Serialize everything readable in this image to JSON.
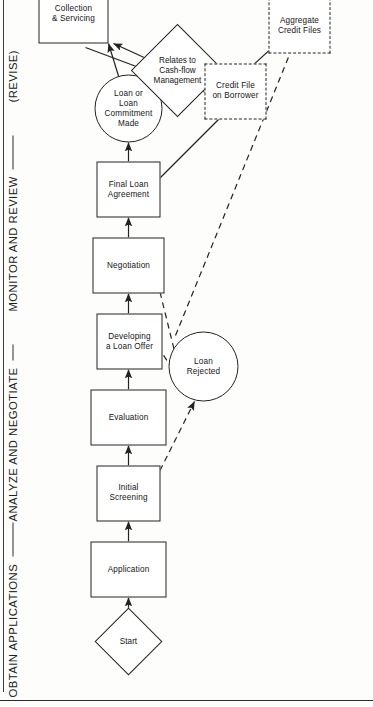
{
  "figure": {
    "orientation": "landscape-printed-sideways",
    "line_color": "#222222",
    "background": "#fdfdfc"
  },
  "phases": [
    {
      "id": "obtain",
      "label": "OBTAIN APPLICATIONS"
    },
    {
      "id": "analyze",
      "label": "ANALYZE AND NEGOTIATE"
    },
    {
      "id": "monitor",
      "label": "MONITOR AND REVIEW"
    },
    {
      "id": "revise",
      "label": "(REVISE)"
    }
  ],
  "nodes": [
    {
      "id": "start",
      "shape": "diamond",
      "label": "Start"
    },
    {
      "id": "application",
      "shape": "box",
      "label": "Application"
    },
    {
      "id": "screening",
      "shape": "box",
      "label": "Initial\nScreening"
    },
    {
      "id": "evaluation",
      "shape": "box",
      "label": "Evaluation"
    },
    {
      "id": "developing",
      "shape": "box",
      "label": "Developing\na Loan Offer"
    },
    {
      "id": "negotiation",
      "shape": "box",
      "label": "Negotiation"
    },
    {
      "id": "agreement",
      "shape": "box",
      "label": "Final Loan\nAgreement"
    },
    {
      "id": "commitment",
      "shape": "circle",
      "label": "Loan or\nLoan\nCommitment\nMade"
    },
    {
      "id": "cashflow",
      "shape": "diamond",
      "label": "Relates to\nCash-flow\nManagement"
    },
    {
      "id": "collection",
      "shape": "box",
      "label": "Collection\n& Servicing"
    },
    {
      "id": "rejected",
      "shape": "circle",
      "label": "Loan\nRejected"
    },
    {
      "id": "creditfile",
      "shape": "box-dashed",
      "label": "Credit File\non Borrower"
    },
    {
      "id": "aggregate",
      "shape": "box-dashed",
      "label": "Aggregate\nCredit Files"
    }
  ],
  "edges": [
    {
      "from": "start",
      "to": "application",
      "style": "solid"
    },
    {
      "from": "application",
      "to": "screening",
      "style": "solid"
    },
    {
      "from": "screening",
      "to": "evaluation",
      "style": "solid"
    },
    {
      "from": "evaluation",
      "to": "developing",
      "style": "solid"
    },
    {
      "from": "developing",
      "to": "negotiation",
      "style": "solid"
    },
    {
      "from": "negotiation",
      "to": "agreement",
      "style": "solid"
    },
    {
      "from": "agreement",
      "to": "commitment",
      "style": "solid"
    },
    {
      "from": "commitment",
      "to": "collection",
      "style": "solid"
    },
    {
      "from": "commitment",
      "to": "cashflow",
      "style": "solid"
    },
    {
      "from": "cashflow",
      "to": "collection",
      "style": "solid"
    },
    {
      "from": "agreement",
      "to": "creditfile",
      "style": "solid"
    },
    {
      "from": "collection",
      "to": "creditfile",
      "style": "solid"
    },
    {
      "from": "creditfile",
      "to": "aggregate",
      "style": "solid"
    },
    {
      "from": "screening",
      "to": "rejected",
      "style": "dashed"
    },
    {
      "from": "developing",
      "to": "rejected",
      "style": "dashed"
    },
    {
      "from": "negotiation",
      "to": "rejected",
      "style": "dashed"
    },
    {
      "from": "rejected",
      "to": "aggregate",
      "style": "dashed"
    }
  ]
}
